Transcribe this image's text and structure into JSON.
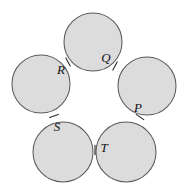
{
  "figure": {
    "background_color": "#ffffff",
    "width": 189,
    "height": 195
  },
  "chart_data": {
    "type": "diagram",
    "shape_fill": "#dcdcdc",
    "shape_stroke": "#5a5a5a",
    "grid": false,
    "legend": false,
    "axes": false,
    "circles": [
      {
        "name": "top-circle",
        "cx": 93,
        "cy": 42,
        "r": 29
      },
      {
        "name": "left-circle",
        "cx": 41,
        "cy": 84,
        "r": 29
      },
      {
        "name": "right-circle",
        "cx": 147,
        "cy": 86,
        "r": 29
      },
      {
        "name": "bottom-left-circle",
        "cx": 63,
        "cy": 152,
        "r": 30
      },
      {
        "name": "bottom-right-circle",
        "cx": 126,
        "cy": 152,
        "r": 30
      }
    ],
    "tangency_points": [
      {
        "id": "P",
        "label": "P",
        "x": 140,
        "y": 117,
        "label_x": 138,
        "label_y": 109,
        "tick_angle": 35
      },
      {
        "id": "Q",
        "label": "Q",
        "x": 115,
        "y": 66,
        "label_x": 106,
        "label_y": 59,
        "tick_angle": 118
      },
      {
        "id": "R",
        "label": "R",
        "x": 68,
        "y": 62,
        "label_x": 61,
        "label_y": 71,
        "tick_angle": 62
      },
      {
        "id": "S",
        "label": "S",
        "x": 54,
        "y": 116,
        "label_x": 57,
        "label_y": 128,
        "tick_angle": 160
      },
      {
        "id": "T",
        "label": "T",
        "x": 95,
        "y": 150,
        "label_x": 104,
        "label_y": 149,
        "tick_angle": 90
      }
    ]
  },
  "labels": {
    "P": "P",
    "Q": "Q",
    "R": "R",
    "S": "S",
    "T": "T"
  }
}
